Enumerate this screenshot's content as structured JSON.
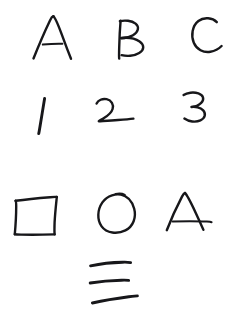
{
  "page": {
    "background_color": "#ffffff",
    "ink_color": "#17171a",
    "width": 227,
    "height": 321,
    "medium": "ink-on-paper"
  },
  "rows": [
    {
      "row_name": "letters-row",
      "label": "A B C",
      "cells": [
        {
          "glyph": "A",
          "kind": "letter",
          "icon": "letter-a-glyph"
        },
        {
          "glyph": "B",
          "kind": "letter",
          "icon": "letter-b-glyph"
        },
        {
          "glyph": "C",
          "kind": "letter",
          "icon": "letter-c-glyph"
        }
      ]
    },
    {
      "row_name": "digits-row",
      "label": "1 2 3",
      "cells": [
        {
          "glyph": "1",
          "kind": "digit",
          "icon": "digit-one-glyph"
        },
        {
          "glyph": "2",
          "kind": "digit",
          "icon": "digit-two-glyph"
        },
        {
          "glyph": "3",
          "kind": "digit",
          "icon": "digit-three-glyph"
        }
      ]
    },
    {
      "row_name": "shapes-row",
      "label": "square circle triangle",
      "cells": [
        {
          "glyph": "square",
          "kind": "shape",
          "icon": "square-shape-glyph"
        },
        {
          "glyph": "circle",
          "kind": "shape",
          "icon": "circle-shape-glyph"
        },
        {
          "glyph": "triangle",
          "kind": "shape",
          "icon": "triangle-a-shape-glyph"
        }
      ]
    },
    {
      "row_name": "strokes-row",
      "label": "three horizontal strokes",
      "cells": [
        {
          "glyph": "line",
          "kind": "stroke",
          "icon": "horizontal-stroke-glyph"
        },
        {
          "glyph": "line",
          "kind": "stroke",
          "icon": "horizontal-stroke-glyph"
        },
        {
          "glyph": "line",
          "kind": "stroke",
          "icon": "horizontal-stroke-glyph"
        }
      ]
    }
  ]
}
